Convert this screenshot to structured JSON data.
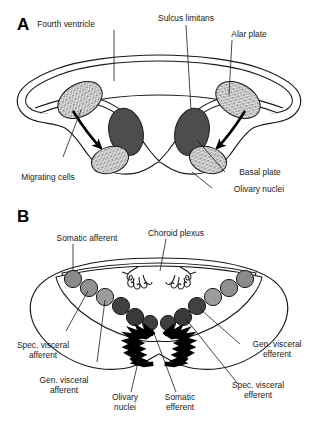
{
  "figure": {
    "type": "anatomical-diagram",
    "panels": [
      {
        "id": "A",
        "letter": "A",
        "description": "Early medulla cross-section showing alar and basal plates, sulcus limitans, and cells migrating from the alar plate to form the olivary nuclei",
        "labels": [
          {
            "key": "fourth_ventricle",
            "text": "Fourth ventricle"
          },
          {
            "key": "sulcus_limitans",
            "text": "Sulcus limitans"
          },
          {
            "key": "alar_plate",
            "text": "Alar plate"
          },
          {
            "key": "basal_plate",
            "text": "Basal plate"
          },
          {
            "key": "migrating_cells",
            "text": "Migrating cells"
          },
          {
            "key": "olivary_nuclei",
            "text": "Olivary nuclei"
          }
        ],
        "structures": [
          {
            "key": "alar-plate-nucleus",
            "fill": "stipple",
            "count": 2
          },
          {
            "key": "basal-plate-nucleus",
            "fill": "#4d4d4d",
            "count": 2
          },
          {
            "key": "olivary-nucleus-primordium",
            "fill": "stipple",
            "count": 2
          },
          {
            "key": "migration-arrow",
            "count": 2
          }
        ]
      },
      {
        "id": "B",
        "letter": "B",
        "description": "Mature medulla cross-section showing the functional columns of cranial nerve nuclei and the olivary nuclei",
        "labels": [
          {
            "key": "somatic_afferent",
            "text": "Somatic afferent"
          },
          {
            "key": "choroid_plexus",
            "text": "Choroid plexus"
          },
          {
            "key": "gen_visceral_efferent",
            "text": "Gen. visceral\nefferent"
          },
          {
            "key": "spec_visceral_afferent",
            "text": "Spec. visceral\nafferent"
          },
          {
            "key": "gen_visceral_afferent",
            "text": "Gen. visceral\nafferent"
          },
          {
            "key": "olivary_nuclei",
            "text": "Olivary\nnuclei"
          },
          {
            "key": "somatic_efferent",
            "text": "Somatic\nefferent"
          },
          {
            "key": "spec_visceral_efferent",
            "text": "Spec. visceral\nefferent"
          }
        ],
        "nuclei_columns": [
          {
            "key": "somatic-afferent",
            "shade": "#8a8a8a",
            "side": "both"
          },
          {
            "key": "spec-visceral-afferent",
            "shade": "#8f8f8f",
            "side": "both"
          },
          {
            "key": "gen-visceral-afferent",
            "shade": "#9a9a9a",
            "side": "both"
          },
          {
            "key": "gen-visceral-efferent",
            "shade": "#414141",
            "side": "both"
          },
          {
            "key": "spec-visceral-efferent",
            "shade": "#3a3a3a",
            "side": "both"
          },
          {
            "key": "somatic-efferent",
            "shade": "#3f3f3f",
            "side": "both"
          }
        ],
        "structures": [
          {
            "key": "choroid-plexus-tuft",
            "count": 2
          },
          {
            "key": "olivary-nucleus",
            "fill": "#000000",
            "count": 2
          }
        ]
      }
    ],
    "colors": {
      "outline": "#1a1a1a",
      "background": "#ffffff",
      "dark_nucleus": "#4d4d4d",
      "light_nucleus_stipple": "#b8b8b8",
      "black_nucleus": "#000000",
      "label_text": "#1a1a1a"
    }
  }
}
